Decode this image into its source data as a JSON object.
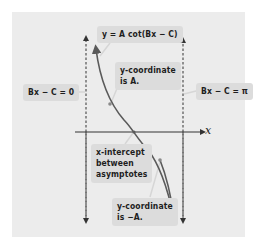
{
  "diagram": {
    "labels": {
      "equation": "y = A cot(Bx − C)",
      "left_asymptote": "Bx − C = 0",
      "right_asymptote": "Bx − C = π",
      "y_coord_a_line1": "y-coordinate",
      "y_coord_a_line2": "is A.",
      "x_intercept_line1": "x-intercept",
      "x_intercept_line2": "between",
      "x_intercept_line3": "asymptotes",
      "y_coord_neg_a_line1": "y-coordinate",
      "y_coord_neg_a_line2": "is −A.",
      "x_axis": "x"
    },
    "colors": {
      "panel": "#ececec",
      "label_box": "#dcdcdc",
      "curve": "#5a5a5a",
      "axis": "#333333",
      "asymptote": "#333333"
    }
  }
}
